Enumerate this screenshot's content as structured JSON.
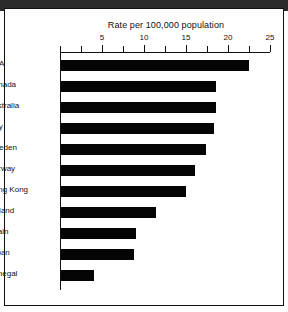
{
  "figure": {
    "title": "Rate per 100,000 population",
    "frame_color": "#111111",
    "bar_color": "#050505",
    "background": "#ffffff"
  },
  "axis": {
    "tick_labels": [
      "5",
      "10",
      "15",
      "20",
      "25"
    ],
    "tick_values": [
      5,
      10,
      15,
      20,
      25
    ],
    "minor_step": 2.5,
    "min": 0,
    "max": 25
  },
  "chart_data": {
    "type": "bar",
    "orientation": "horizontal",
    "title": "Rate per 100,000 population",
    "xlabel": "Rate per 100,000 population",
    "ylabel": "",
    "xlim": [
      0,
      25
    ],
    "grid": false,
    "legend": false,
    "categories": [
      "USA",
      "Canada",
      "Australia",
      "Italy",
      "Sweden",
      "Norway",
      "Hong Kong",
      "Finland",
      "Spain",
      "Japan",
      "Senegal"
    ],
    "values": [
      22.4,
      18.5,
      18.5,
      18.2,
      17.3,
      16.0,
      14.9,
      11.3,
      8.9,
      8.7,
      3.9
    ],
    "tick_labels": [
      "5",
      "10",
      "15",
      "20",
      "25"
    ],
    "series": [
      {
        "name": "Rate per 100,000 population",
        "values": [
          22.4,
          18.5,
          18.5,
          18.2,
          17.3,
          16.0,
          14.9,
          11.3,
          8.9,
          8.7,
          3.9
        ]
      }
    ]
  }
}
